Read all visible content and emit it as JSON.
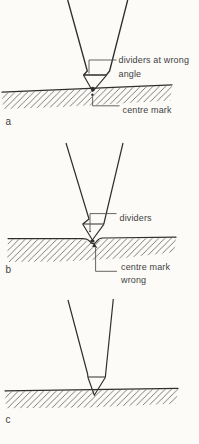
{
  "page": {
    "background": "#fcfbf8"
  },
  "palette": {
    "ink": "#2f2f2f",
    "hatch": "#6d6d6d",
    "text": "#3f3f3f"
  },
  "figures": [
    {
      "label": "a",
      "annotations": [
        {
          "id": "dividers-at-wrong-angle",
          "lines": [
            "dividers at wrong",
            "angle"
          ]
        },
        {
          "id": "centre-mark",
          "lines": [
            "centre mark"
          ]
        }
      ]
    },
    {
      "label": "b",
      "annotations": [
        {
          "id": "dividers",
          "lines": [
            "dividers"
          ]
        },
        {
          "id": "centre-mark-wrong",
          "lines": [
            "centre mark",
            "wrong"
          ]
        }
      ]
    },
    {
      "label": "c",
      "annotations": []
    }
  ]
}
